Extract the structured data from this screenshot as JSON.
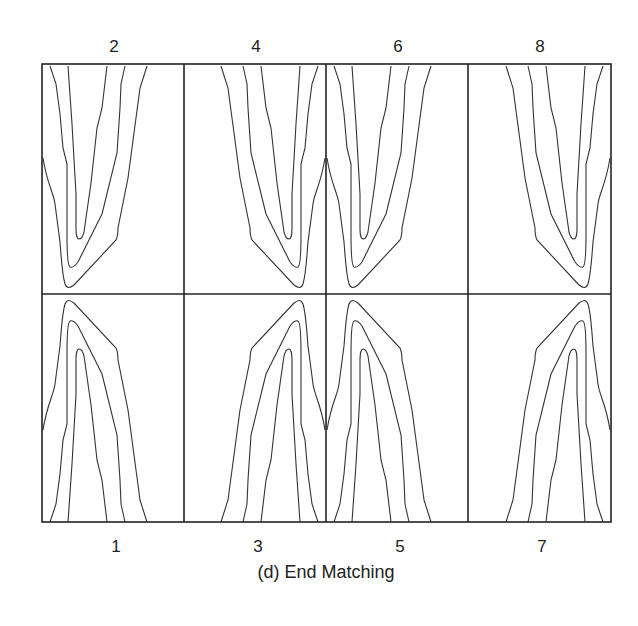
{
  "figure": {
    "caption": "(d) End Matching",
    "top_labels": [
      "2",
      "4",
      "6",
      "8"
    ],
    "bottom_labels": [
      "1",
      "3",
      "5",
      "7"
    ],
    "grid": {
      "rows": 2,
      "cols": 4
    },
    "panels": [
      {
        "id": "1",
        "row": "bottom",
        "col": 1,
        "orientation": "peak-up",
        "mirror": false
      },
      {
        "id": "2",
        "row": "top",
        "col": 1,
        "orientation": "peak-down",
        "mirror": false
      },
      {
        "id": "3",
        "row": "bottom",
        "col": 2,
        "orientation": "peak-up",
        "mirror": true
      },
      {
        "id": "4",
        "row": "top",
        "col": 2,
        "orientation": "peak-down",
        "mirror": true
      },
      {
        "id": "5",
        "row": "bottom",
        "col": 3,
        "orientation": "peak-up",
        "mirror": false
      },
      {
        "id": "6",
        "row": "top",
        "col": 3,
        "orientation": "peak-down",
        "mirror": false
      },
      {
        "id": "7",
        "row": "bottom",
        "col": 4,
        "orientation": "peak-up",
        "mirror": true
      },
      {
        "id": "8",
        "row": "top",
        "col": 4,
        "orientation": "peak-down",
        "mirror": true
      }
    ],
    "contours_per_panel": 3,
    "line_color": "#333333",
    "border_color": "#222222"
  }
}
